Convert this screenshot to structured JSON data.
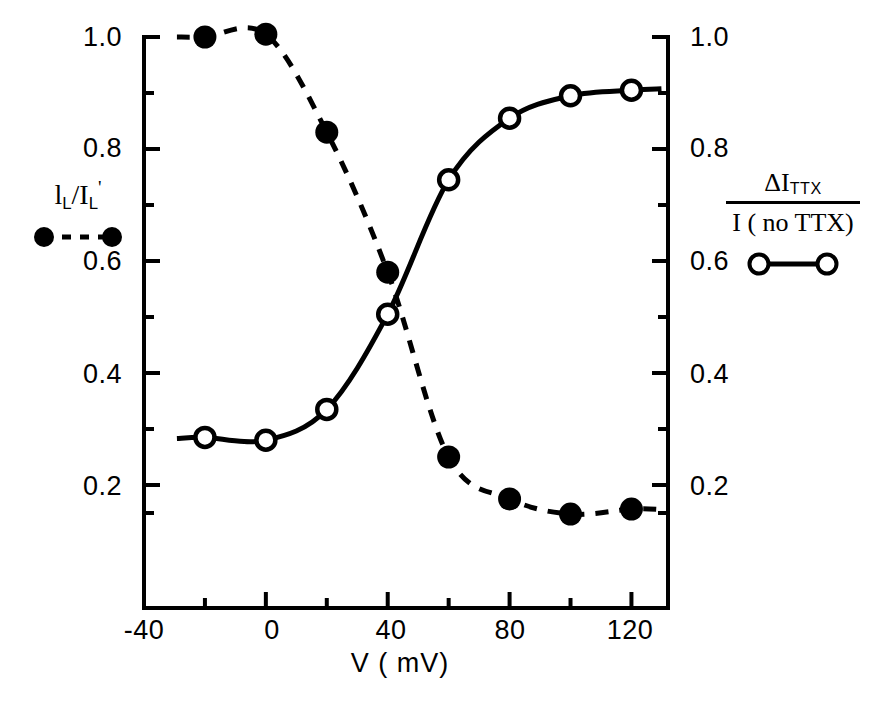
{
  "chart_data": {
    "type": "line",
    "title": "",
    "xlabel": "V ( mV)",
    "ylabel_left": "l L / I L '",
    "ylabel_right": "ΔI TTX / I ( no TTX)",
    "xlim": [
      -40,
      132
    ],
    "ylim": [
      0.1,
      1.04
    ],
    "grid": false,
    "legend_position": "outside-left-and-right",
    "x_ticks": [
      -40,
      0,
      40,
      80,
      120
    ],
    "x_tick_labels": [
      "-40",
      "0",
      "40",
      "80",
      "120"
    ],
    "x_minor_ticks": [
      -20,
      20,
      60,
      100
    ],
    "y_ticks": [
      0.2,
      0.4,
      0.6,
      0.8,
      1.0
    ],
    "y_tick_labels": [
      "0.2",
      "0.4",
      "0.6",
      "0.8",
      "1.0"
    ],
    "y_minor_ticks": [
      0.3,
      0.5,
      0.7,
      0.9,
      0.15
    ],
    "series": [
      {
        "name": "l_L / I_L'",
        "marker": "filled-circle",
        "linestyle": "dashed",
        "color": "#000000",
        "axis": "left",
        "x": [
          -20,
          0,
          20,
          40,
          60,
          80,
          100,
          120
        ],
        "values": [
          1.0,
          1.005,
          0.83,
          0.58,
          0.25,
          0.175,
          0.148,
          0.157
        ]
      },
      {
        "name": "ΔI_TTX / I(no TTX)",
        "marker": "open-circle",
        "linestyle": "solid",
        "color": "#000000",
        "axis": "right",
        "x": [
          -20,
          0,
          20,
          40,
          60,
          80,
          100,
          120
        ],
        "values": [
          0.285,
          0.28,
          0.335,
          0.505,
          0.745,
          0.855,
          0.895,
          0.905
        ]
      }
    ]
  },
  "axes": {
    "x_title": "V ( mV)",
    "x_tick_labels": [
      "-40",
      "0",
      "40",
      "80",
      "120"
    ],
    "y_tick_labels_left": [
      "1.0",
      "0.8",
      "0.6",
      "0.4",
      "0.2"
    ],
    "y_tick_labels_right": [
      "1.0",
      "0.8",
      "0.6",
      "0.4",
      "0.2"
    ]
  },
  "legend_left": {
    "numerator_main": "l",
    "numerator_sub": "L",
    "slash": "/",
    "denominator_main": "I",
    "denominator_sub": "L",
    "prime": "'",
    "marker": "filled-circle",
    "linestyle": "dashed"
  },
  "legend_right": {
    "numerator_delta": "Δ",
    "numerator_main": "I",
    "numerator_sub": "TTX",
    "denominator": "I ( no TTX)",
    "marker": "open-circle",
    "linestyle": "solid"
  },
  "colors": {
    "ink": "#000000",
    "background": "#ffffff"
  }
}
